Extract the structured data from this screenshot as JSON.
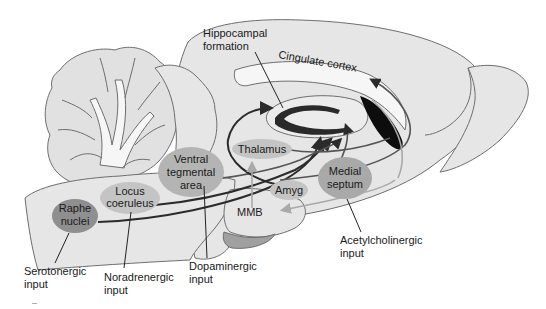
{
  "figure": {
    "colors": {
      "background": "#ffffff",
      "brain_fill": "#e6e6e6",
      "outline": "#6e6e6e",
      "oval_light": "#c4c4c4",
      "oval_dark": "#8f8f8f",
      "pathway_dark": "#2b2b2b",
      "pathway_light": "#a9a9a9",
      "septal_black": "#0d0d0d"
    }
  },
  "structures": {
    "hippocampal_formation": {
      "line1": "Hippocampal",
      "line2": "formation"
    },
    "cingulate_cortex": "Cingulate cortex",
    "thalamus": "Thalamus",
    "amyg": "Amyg",
    "mmb": "MMB",
    "medial_septum": {
      "line1": "Medial",
      "line2": "septum"
    },
    "vta": {
      "line1": "Ventral",
      "line2": "tegmental",
      "line3": "area"
    },
    "locus_coeruleus": {
      "line1": "Locus",
      "line2": "coeruleus"
    },
    "raphe_nuclei": {
      "line1": "Raphe",
      "line2": "nuclei"
    }
  },
  "inputs": {
    "serotonergic": {
      "line1": "Serotonergic",
      "line2": "input"
    },
    "noradrenergic": {
      "line1": "Noradrenergic",
      "line2": "input"
    },
    "dopaminergic": {
      "line1": "Dopaminergic",
      "line2": "input"
    },
    "acetylcholinergic": {
      "line1": "Acetylcholinergic",
      "line2": "input"
    }
  },
  "corner_mark": "–"
}
